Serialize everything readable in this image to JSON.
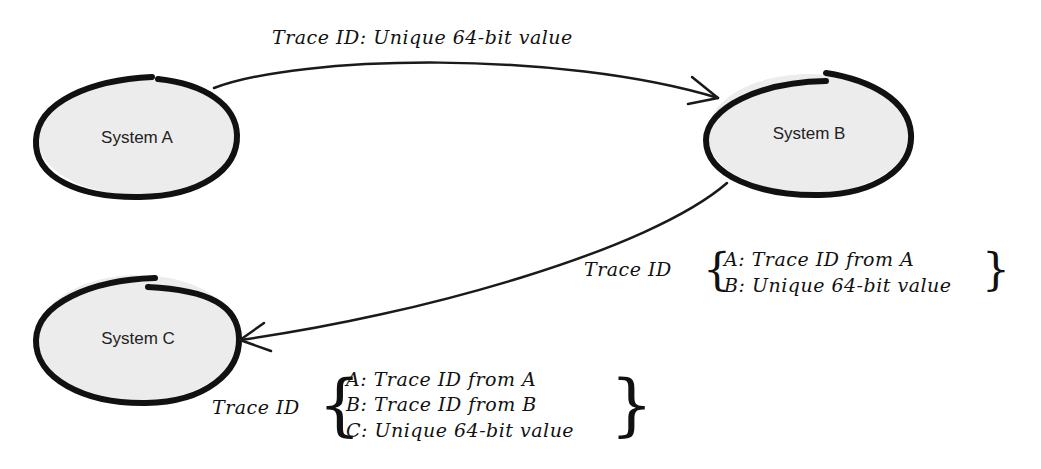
{
  "diagram": {
    "type": "flow",
    "colors": {
      "node_fill": "#ececec",
      "node_stroke": "#111111",
      "edge": "#1a1a1a",
      "text": "#111111",
      "background": "#ffffff"
    },
    "nodes": [
      {
        "id": "A",
        "label": "System A"
      },
      {
        "id": "B",
        "label": "System B"
      },
      {
        "id": "C",
        "label": "System C"
      }
    ],
    "edges": [
      {
        "from": "A",
        "to": "B",
        "label": "Trace ID: Unique 64-bit value"
      },
      {
        "from": "B",
        "to": "C",
        "label_prefix": "Trace ID",
        "entries": [
          "A: Trace ID from A",
          "B: Unique 64-bit value"
        ]
      }
    ],
    "node_c_annotation": {
      "label_prefix": "Trace ID",
      "entries": [
        "A: Trace ID from A",
        "B: Trace ID from B",
        "C: Unique 64-bit value"
      ]
    }
  }
}
